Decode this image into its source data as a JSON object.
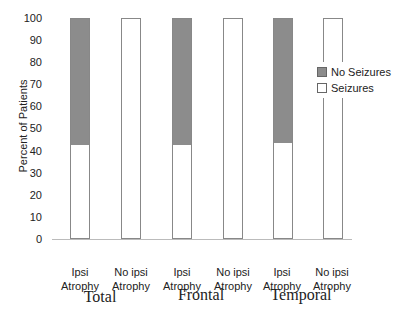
{
  "chart_data": {
    "type": "bar",
    "stacked": true,
    "title": "",
    "xlabel": "",
    "ylabel": "Percent of Patients",
    "ylim": [
      0,
      100
    ],
    "yticks": [
      0,
      10,
      20,
      30,
      40,
      50,
      60,
      70,
      80,
      90,
      100
    ],
    "categories": [
      "Ipsi Atrophy",
      "No ipsi Atrophy",
      "Ipsi Atrophy",
      "No ipsi Atrophy",
      "Ipsi Atrophy",
      "No ipsi Atrophy"
    ],
    "groups": [
      "Total",
      "Frontal",
      "Temporal"
    ],
    "series": [
      {
        "name": "Seizures",
        "color": "#ffffff",
        "values": [
          43,
          100,
          43,
          100,
          44,
          100
        ]
      },
      {
        "name": "No Seizures",
        "color": "#8c8c8c",
        "values": [
          57,
          0,
          57,
          0,
          56,
          0
        ]
      }
    ],
    "legend_position": "right",
    "grid": false
  },
  "labels": {
    "ylabel": "Percent of Patients",
    "ticks": [
      "0",
      "10",
      "20",
      "30",
      "40",
      "50",
      "60",
      "70",
      "80",
      "90",
      "100"
    ],
    "cat_line1": [
      "Ipsi",
      "No ipsi",
      "Ipsi",
      "No ipsi",
      "Ipsi",
      "No ipsi"
    ],
    "cat_line2": [
      "Atrophy",
      "Atrophy",
      "Atrophy",
      "Atrophy",
      "Atrophy",
      "Atrophy"
    ],
    "groups": [
      "Total",
      "Frontal",
      "Temporal"
    ],
    "legend": [
      "No Seizures",
      "Seizures"
    ]
  }
}
